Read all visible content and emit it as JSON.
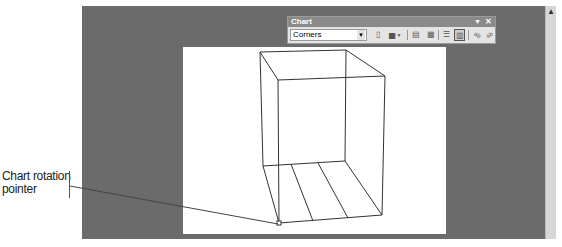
{
  "toolbar": {
    "title": "Chart",
    "menu_icon": "toolbar-options-arrow",
    "close_icon": "close-icon",
    "chart_objects_dropdown": {
      "selected": "Corners"
    },
    "buttons": [
      {
        "name": "format-selected-object",
        "glyph": "▯"
      },
      {
        "name": "chart-type",
        "glyph": "▅"
      },
      {
        "name": "legend",
        "glyph": "▤"
      },
      {
        "name": "data-table",
        "glyph": "▦"
      },
      {
        "name": "by-row",
        "glyph": "☰"
      },
      {
        "name": "by-column",
        "glyph": "▥",
        "pressed": true
      },
      {
        "name": "angle-text-downward",
        "glyph": "ab"
      },
      {
        "name": "angle-text-upward",
        "glyph": "ab"
      }
    ]
  },
  "callout": {
    "line1": "Chart rotation",
    "line2": "pointer"
  },
  "colors": {
    "workspace": "#6b6b6b",
    "chart_area": "#ffffff",
    "toolbar": "#e4e4e4",
    "toolbar_title": "#8a8a8a"
  }
}
